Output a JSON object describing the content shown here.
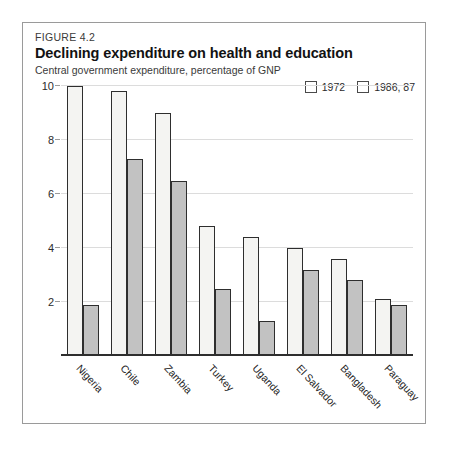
{
  "figure": {
    "number": "FIGURE 4.2",
    "title": "Declining expenditure on health and education",
    "subtitle": "Central government expenditure, percentage of GNP"
  },
  "colors": {
    "series1_fill": "#f4f4f2",
    "series2_fill": "#c2c2c2",
    "bar_outline": "#2e2e2e",
    "gridline": "#dcdcdc",
    "frame": "#9a9a9a",
    "text": "#1f1f1f"
  },
  "chart_data": {
    "type": "bar",
    "title": "Declining expenditure on health and education",
    "subtitle": "Central government expenditure, percentage of GNP",
    "xlabel": "",
    "ylabel": "",
    "ylim": [
      0,
      10
    ],
    "yticks": [
      2,
      4,
      6,
      8,
      10
    ],
    "ytick_labels": [
      "2",
      "4",
      "6",
      "8",
      "10"
    ],
    "grid": true,
    "legend_position": "top-right",
    "categories": [
      "Nigeria",
      "Chile",
      "Zambia",
      "Turkey",
      "Uganda",
      "El Salvador",
      "Bangladesh",
      "Paraguay"
    ],
    "series": [
      {
        "name": "1972",
        "values": [
          10.0,
          9.8,
          9.0,
          4.8,
          4.4,
          4.0,
          3.6,
          2.1
        ]
      },
      {
        "name": "1986, 87",
        "values": [
          1.9,
          7.3,
          6.5,
          2.5,
          1.3,
          3.2,
          2.8,
          1.9
        ]
      }
    ]
  }
}
